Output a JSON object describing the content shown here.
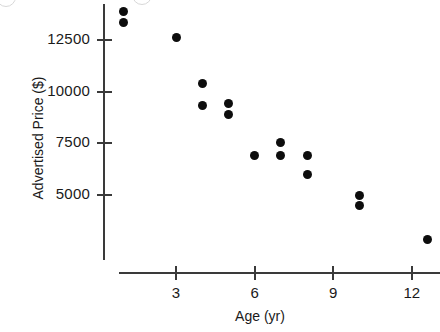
{
  "chart_data": {
    "type": "scatter",
    "title": "",
    "xlabel": "Age (yr)",
    "ylabel": "Advertised Price ($)",
    "xlim": [
      0,
      13.6
    ],
    "ylim": [
      2000,
      14400
    ],
    "grid": false,
    "legend": "none",
    "xticks": [
      3,
      6,
      9,
      12
    ],
    "xtick_labels": [
      "3",
      "6",
      "9",
      "12"
    ],
    "yticks": [
      5000,
      7500,
      10000,
      12500
    ],
    "ytick_labels": [
      "5000",
      "7500",
      "10000",
      "12500"
    ],
    "marker": "filled-circle",
    "marker_color": "#0d0d0d",
    "axis_color": "#3a3a3a",
    "background_color": "#ffffff",
    "points": [
      {
        "x": 1,
        "y": 13900
      },
      {
        "x": 1,
        "y": 13370
      },
      {
        "x": 3,
        "y": 12600
      },
      {
        "x": 4,
        "y": 10400
      },
      {
        "x": 4,
        "y": 9350
      },
      {
        "x": 5,
        "y": 9450
      },
      {
        "x": 5,
        "y": 8900
      },
      {
        "x": 6,
        "y": 6900
      },
      {
        "x": 7,
        "y": 7550
      },
      {
        "x": 7,
        "y": 6900
      },
      {
        "x": 8,
        "y": 6900
      },
      {
        "x": 8,
        "y": 6000
      },
      {
        "x": 10,
        "y": 5000
      },
      {
        "x": 10,
        "y": 4500
      },
      {
        "x": 12.6,
        "y": 2850
      }
    ]
  },
  "artifacts": [
    {
      "cx": 5,
      "cy": -4,
      "r": 9
    },
    {
      "cx": 141,
      "cy": -6,
      "r": 9
    }
  ]
}
